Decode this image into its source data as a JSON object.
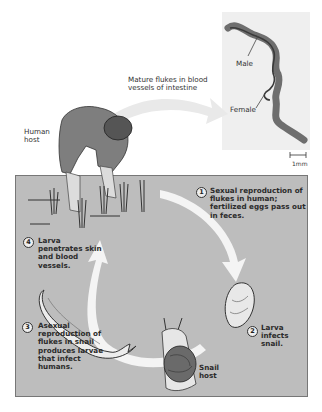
{
  "diagram": {
    "labels": {
      "mature_flukes": "Mature flukes in blood vessels of intestine",
      "human_host": "Human host",
      "male": "Male",
      "female": "Female",
      "scale_bar": "1mm",
      "snail_host": "Snail host"
    },
    "steps": [
      {
        "number": "1",
        "text": "Sexual reproduction of flukes in human; fertilized eggs pass out in feces."
      },
      {
        "number": "2",
        "text": "Larva infects snail."
      },
      {
        "number": "3",
        "text": "Asexual reproduction of flukes in snail produces larvae that infect humans."
      },
      {
        "number": "4",
        "text": "Larva penetrates skin and blood vessels."
      }
    ],
    "colors": {
      "panel": "#bdbdbd",
      "arrow": "#f4f4f4",
      "micrograph_bg": "#efefef",
      "worm": "#6e6e6e",
      "figure": "#7a7a7a"
    }
  }
}
